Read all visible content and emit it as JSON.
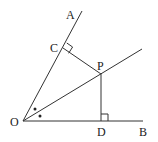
{
  "diagram": {
    "type": "geometry",
    "points": {
      "O": {
        "label": "O",
        "x": 23,
        "y": 121
      },
      "A": {
        "label": "A",
        "x": 82,
        "y": 11
      },
      "B": {
        "label": "B",
        "x": 143,
        "y": 121
      },
      "C": {
        "label": "C",
        "x": 63,
        "y": 48
      },
      "P": {
        "label": "P",
        "x": 101,
        "y": 74
      },
      "D": {
        "label": "D",
        "x": 101,
        "y": 121
      }
    },
    "segments": [
      {
        "from": "O",
        "to": "A",
        "name": "ray-OA"
      },
      {
        "from": "O",
        "to": "B",
        "name": "ray-OB"
      },
      {
        "from": "O",
        "to": "bisector_end",
        "name": "bisector-ray"
      },
      {
        "from": "C",
        "to": "P",
        "name": "segment-CP"
      },
      {
        "from": "P",
        "to": "D",
        "name": "segment-PD"
      }
    ],
    "bisector_end": {
      "x": 142,
      "y": 49
    },
    "right_angles": [
      "C",
      "D"
    ],
    "equal_angle_marks": [
      "angle-AOP",
      "angle-POB"
    ],
    "colors": {
      "line": "#333333",
      "text": "#222222",
      "background": "#ffffff"
    }
  }
}
